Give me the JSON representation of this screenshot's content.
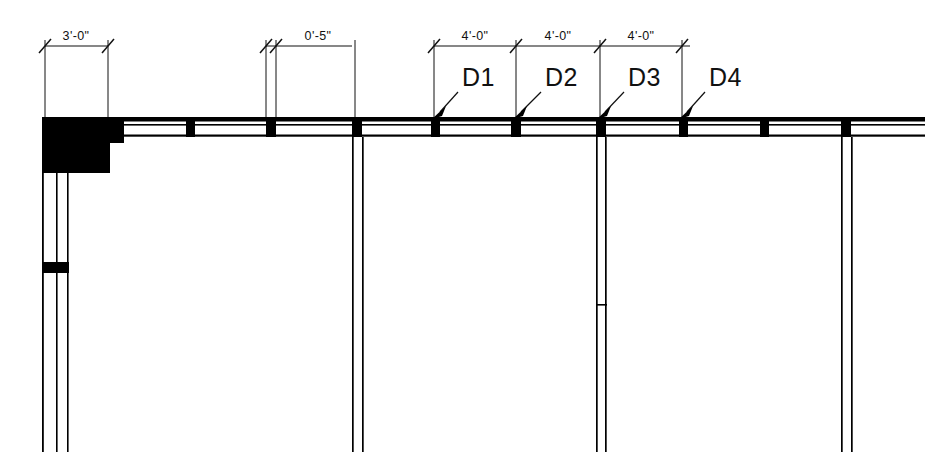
{
  "drawing": {
    "title": "Partial Floor Plan - Wall Framing Layout",
    "background_color": "#ffffff",
    "ink_color": "#000000",
    "width": 950,
    "height": 454
  },
  "dimensions": [
    {
      "id": "dim-3-0",
      "label": "3'-0\"",
      "x1": 45,
      "x2": 108,
      "text_x": 76,
      "text_y": 40,
      "line_y": 46,
      "ext_top": 46,
      "ext_bottom": 118
    },
    {
      "id": "dim-0-5",
      "label": "0'-5\"",
      "x1": 266,
      "x2": 276,
      "text_x": 318,
      "text_y": 40,
      "line_y": 46,
      "ext_top": 46,
      "ext_bottom": 118
    },
    {
      "id": "dim-4-0-a",
      "label": "4'-0\"",
      "x1": 434,
      "x2": 516,
      "text_x": 475,
      "text_y": 40,
      "line_y": 46,
      "ext_top": 46,
      "ext_bottom": 118
    },
    {
      "id": "dim-4-0-b",
      "label": "4'-0\"",
      "x1": 516,
      "x2": 600,
      "text_x": 558,
      "text_y": 40,
      "line_y": 46,
      "ext_top": 46,
      "ext_bottom": 118
    },
    {
      "id": "dim-4-0-c",
      "label": "4'-0\"",
      "x1": 600,
      "x2": 682,
      "text_x": 641,
      "text_y": 40,
      "line_y": 46,
      "ext_top": 46,
      "ext_bottom": 118
    }
  ],
  "dimension_line": {
    "y": 46,
    "segments": [
      {
        "x1": 45,
        "x2": 108
      },
      {
        "x1": 266,
        "x2": 352
      },
      {
        "x1": 434,
        "x2": 690
      }
    ]
  },
  "extension_lines": [
    {
      "x": 45,
      "y1": 40,
      "y2": 118
    },
    {
      "x": 108,
      "y1": 40,
      "y2": 118
    },
    {
      "x": 266,
      "y1": 40,
      "y2": 118
    },
    {
      "x": 276,
      "y1": 40,
      "y2": 118
    },
    {
      "x": 355,
      "y1": 40,
      "y2": 118
    },
    {
      "x": 434,
      "y1": 40,
      "y2": 118
    },
    {
      "x": 516,
      "y1": 40,
      "y2": 118
    },
    {
      "x": 600,
      "y1": 40,
      "y2": 118
    },
    {
      "x": 682,
      "y1": 40,
      "y2": 118
    }
  ],
  "door_tags": [
    {
      "id": "d1",
      "label": "D1",
      "text_x": 462,
      "text_y": 86,
      "leader_x1": 458,
      "leader_y1": 92,
      "leader_x2": 437,
      "leader_y2": 115
    },
    {
      "id": "d2",
      "label": "D2",
      "text_x": 545,
      "text_y": 86,
      "leader_x1": 541,
      "leader_y1": 92,
      "leader_x2": 518,
      "leader_y2": 115
    },
    {
      "id": "d3",
      "label": "D3",
      "text_x": 628,
      "text_y": 86,
      "leader_x1": 624,
      "leader_y1": 92,
      "leader_x2": 602,
      "leader_y2": 115
    },
    {
      "id": "d4",
      "label": "D4",
      "text_x": 709,
      "text_y": 86,
      "leader_x1": 705,
      "leader_y1": 92,
      "leader_x2": 684,
      "leader_y2": 115
    }
  ],
  "top_wall": {
    "x_start": 42,
    "x_end": 925,
    "outer_top_y": 117,
    "outer_top_h": 4,
    "inner_line_y": 125,
    "cavity_bottom_y": 136,
    "bottom_line_h": 2
  },
  "studs": [
    {
      "id": "stud-1",
      "x": 186,
      "width": 9
    },
    {
      "id": "stud-2",
      "x": 266,
      "width": 10
    },
    {
      "id": "stud-3",
      "x": 352,
      "width": 9
    },
    {
      "id": "stud-4",
      "x": 431,
      "width": 9
    },
    {
      "id": "stud-5",
      "x": 511,
      "width": 9
    },
    {
      "id": "stud-6",
      "x": 596,
      "width": 10
    },
    {
      "id": "stud-7",
      "x": 679,
      "width": 9
    },
    {
      "id": "stud-8",
      "x": 760,
      "width": 9
    },
    {
      "id": "stud-9",
      "x": 841,
      "width": 9
    }
  ],
  "corner_block": {
    "x": 42,
    "y": 117,
    "w": 68,
    "h": 56,
    "notch_x": 110,
    "notch_y": 117,
    "notch_w": 12,
    "notch_h": 25
  },
  "left_wall": {
    "x_outer": 42,
    "x_mid": 57,
    "x_inner": 68,
    "y_top": 173,
    "y_bottom": 452,
    "stud_y": 262,
    "stud_h": 12
  },
  "partitions": [
    {
      "id": "partition-a",
      "x_left": 352,
      "x_right": 363,
      "y_top": 136,
      "y_bottom": 452,
      "has_tick": false
    },
    {
      "id": "partition-b",
      "x_left": 596,
      "x_right": 606,
      "y_top": 136,
      "y_bottom": 452,
      "has_tick": true,
      "tick_y": 305
    },
    {
      "id": "partition-c",
      "x_left": 841,
      "x_right": 851,
      "y_top": 136,
      "y_bottom": 452,
      "has_tick": false
    }
  ]
}
